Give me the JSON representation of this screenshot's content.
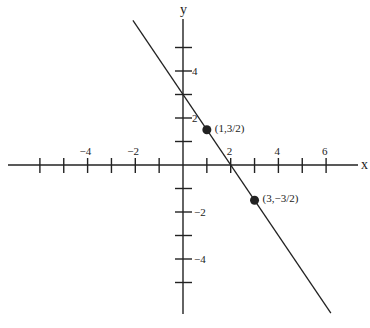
{
  "chart_data": {
    "type": "line",
    "title": "",
    "xlabel": "x",
    "ylabel": "y",
    "xlim": [
      -7.5,
      7.3
    ],
    "ylim": [
      -6.3,
      6.1
    ],
    "grid": false,
    "x_ticks": [
      -6,
      -5,
      -4,
      -3,
      -2,
      -1,
      1,
      2,
      3,
      4,
      5,
      6
    ],
    "x_tick_labels": [
      {
        "value": -4,
        "label": "−4"
      },
      {
        "value": -2,
        "label": "−2"
      },
      {
        "value": 2,
        "label": "2"
      },
      {
        "value": 4,
        "label": "4"
      },
      {
        "value": 6,
        "label": "6"
      }
    ],
    "y_ticks": [
      -5,
      -4,
      -3,
      -2,
      -1,
      1,
      2,
      3,
      4,
      5
    ],
    "y_tick_labels": [
      {
        "value": 4,
        "label": "4"
      },
      {
        "value": 2,
        "label": "2"
      },
      {
        "value": -2,
        "label": "−2"
      },
      {
        "value": -4,
        "label": "−4"
      }
    ],
    "series": [
      {
        "name": "line",
        "equation": "y = -3/2 x + 3",
        "slope": -1.5,
        "intercept": 3,
        "x": [
          -2.1,
          6.2
        ],
        "y": [
          6.15,
          -6.3
        ]
      }
    ],
    "points": [
      {
        "x": 1,
        "y": 1.5,
        "label": "(1,3/2)"
      },
      {
        "x": 3,
        "y": -1.5,
        "label": "(3,−3/2)"
      }
    ]
  },
  "axes": {
    "x_label": "x",
    "y_label": "y"
  },
  "colors": {
    "ink": "#222222",
    "background": "#ffffff"
  }
}
